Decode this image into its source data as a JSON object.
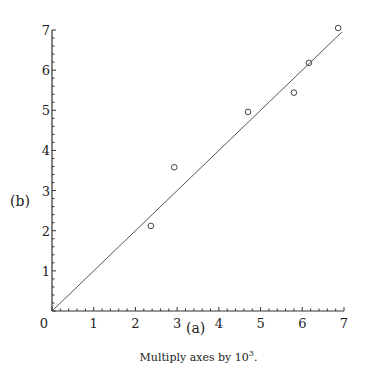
{
  "chart_data": {
    "type": "scatter",
    "title": "",
    "xlabel": "(a)",
    "ylabel": "(b)",
    "xlim": [
      0,
      7
    ],
    "ylim": [
      0,
      7
    ],
    "xticks": [
      0,
      1,
      2,
      3,
      4,
      5,
      6,
      7
    ],
    "yticks": [
      1,
      2,
      3,
      4,
      5,
      6,
      7
    ],
    "minor_ticks_per_unit": 5,
    "grid": false,
    "legend": null,
    "series": [
      {
        "name": "observations",
        "marker": "open-circle",
        "points": [
          {
            "x": 2.37,
            "y": 2.12
          },
          {
            "x": 2.93,
            "y": 3.58
          },
          {
            "x": 4.7,
            "y": 4.96
          },
          {
            "x": 5.8,
            "y": 5.44
          },
          {
            "x": 6.16,
            "y": 6.18
          },
          {
            "x": 6.86,
            "y": 7.05
          }
        ]
      },
      {
        "name": "fit-line",
        "type": "line",
        "points": [
          {
            "x": 0,
            "y": 0
          },
          {
            "x": 6.95,
            "y": 6.95
          }
        ]
      }
    ],
    "annotation": "Multiply axes by 10^3."
  },
  "labels": {
    "origin": "0",
    "xlabel": "(a)",
    "ylabel": "(b)",
    "caption_text": "Multiply axes by 10",
    "caption_exp": "3",
    "caption_end": "."
  }
}
